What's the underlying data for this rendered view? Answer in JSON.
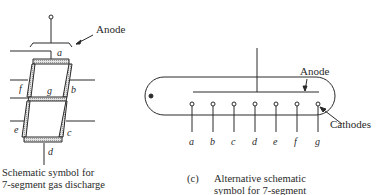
{
  "figure_left": {
    "anode_label": "Anode",
    "segments": [
      "a",
      "b",
      "c",
      "d",
      "e",
      "f",
      "g"
    ],
    "caption_line1": "Schematic symbol for",
    "caption_line2": "7-segment gas discharge"
  },
  "figure_right": {
    "anode_label": "Anode",
    "cathodes_label": "Cathodes",
    "pins": [
      "a",
      "b",
      "c",
      "d",
      "e",
      "f",
      "g"
    ],
    "caption_tag": "(c)",
    "caption_line1": "Alternative schematic",
    "caption_line2": "symbol for 7-segment"
  },
  "colors": {
    "ink": "#2a2a2a",
    "segment_fill": "#d8d8d8"
  }
}
